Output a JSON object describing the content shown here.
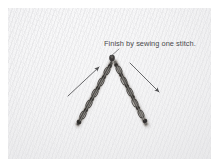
{
  "image": {
    "kind": "embroidery-instruction-photo",
    "subject": "chevron chain stitch on woven fabric",
    "background_color": "#f4f4f5",
    "border_color": "#ffffff"
  },
  "annotations": {
    "caption": "Finish by sewing one stitch.",
    "caption_color": "#4a4a4c",
    "leader_line": {
      "name": "caption-leader-line",
      "from_x": 112,
      "from_y": 50,
      "to_x": 104,
      "to_y": 58,
      "color": "#6e6e70"
    },
    "arrows": [
      {
        "name": "left-direction-arrow",
        "direction": "up-right",
        "from_x": 68,
        "from_y": 95,
        "to_x": 101,
        "to_y": 66,
        "color": "#58585a"
      },
      {
        "name": "right-direction-arrow",
        "direction": "down-right",
        "from_x": 128,
        "from_y": 63,
        "to_x": 160,
        "to_y": 93,
        "color": "#58585a"
      }
    ]
  },
  "stitching": {
    "thread_color": "#4c4a47",
    "thread_highlight": "#9b9792",
    "apex_x": 113,
    "apex_y": 60,
    "left_arm": {
      "name": "left-stitch-arm",
      "start_x": 77,
      "start_y": 124,
      "end_x": 111,
      "end_y": 62
    },
    "right_arm": {
      "name": "right-stitch-arm",
      "start_x": 116,
      "start_y": 62,
      "end_x": 146,
      "end_y": 124
    },
    "apex_stitch": {
      "name": "apex-finishing-stitch",
      "x": 112,
      "y": 58
    }
  }
}
